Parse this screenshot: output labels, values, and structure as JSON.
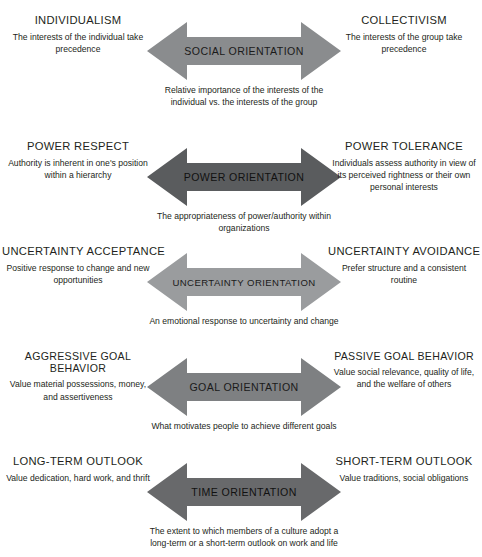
{
  "diagram": {
    "type": "bidirectional-spectrum",
    "background_color": "#ffffff",
    "text_color": "#231f20",
    "rows": [
      {
        "id": "social",
        "arrow_label": "Social Orientation",
        "arrow_color": "#8a8c8e",
        "arrow_caption": "Relative importance of the interests of the individual vs. the interests of the group",
        "left": {
          "title": "Individualism",
          "desc": "The interests of the individual take precedence"
        },
        "right": {
          "title": "Collectivism",
          "desc": "The interests of the group take precedence"
        }
      },
      {
        "id": "power",
        "arrow_label": "Power Orientation",
        "arrow_color": "#5a5c5e",
        "arrow_caption": "The appropriateness of power/authority within organizations",
        "left": {
          "title": "Power Respect",
          "desc": "Authority is inherent in one's position within a hierarchy"
        },
        "right": {
          "title": "Power Tolerance",
          "desc": "Individuals assess authority in view of its perceived rightness or their own personal interests"
        }
      },
      {
        "id": "uncertainty",
        "arrow_label": "Uncertainty Orientation",
        "arrow_color": "#9a9c9e",
        "arrow_caption": "An emotional response to uncertainty and change",
        "left": {
          "title": "Uncertainty Acceptance",
          "desc": "Positive response to change and new opportunities"
        },
        "right": {
          "title": "Uncertainty Avoidance",
          "desc": "Prefer structure and a consistent routine"
        }
      },
      {
        "id": "goal",
        "arrow_label": "Goal Orientation",
        "arrow_color": "#7e8082",
        "arrow_caption": "What motivates people to achieve different goals",
        "left": {
          "title": "Aggressive Goal Behavior",
          "desc": "Value material possessions, money, and assertiveness"
        },
        "right": {
          "title": "Passive Goal Behavior",
          "desc": "Value social relevance, quality of life, and the welfare of others"
        }
      },
      {
        "id": "time",
        "arrow_label": "Time Orientation",
        "arrow_color": "#68696b",
        "arrow_caption": "The extent to which members of a culture adopt a long-term or a short-term outlook on work and life",
        "left": {
          "title": "Long-Term Outlook",
          "desc": "Value dedication, hard work, and thrift"
        },
        "right": {
          "title": "Short-Term Outlook",
          "desc": "Value traditions, social obligations"
        }
      }
    ]
  }
}
